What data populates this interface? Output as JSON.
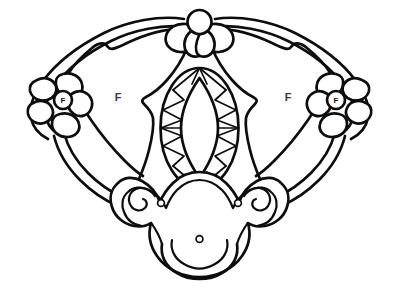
{
  "page": {
    "width": 399,
    "height": 299,
    "background_color": "#ffffff",
    "line_color": "#0d0d0d",
    "style": "black and white outline coloring page"
  },
  "labels": {
    "left_field": "F",
    "right_field": "F",
    "left_flower_center": "F",
    "right_flower_center": "F"
  },
  "artwork": {
    "subject": "symmetrical winged brooch with central oval gemstone",
    "components": [
      {
        "name": "left-wing",
        "description": "double outline scalloped wing panel sweeping left and down"
      },
      {
        "name": "right-wing",
        "description": "double outline scalloped wing panel sweeping right and down"
      },
      {
        "name": "top-flower",
        "description": "four petal blossom with round center at top apex"
      },
      {
        "name": "left-flower",
        "description": "five petal blossom with lettered round center"
      },
      {
        "name": "right-flower",
        "description": "five petal blossom with lettered round center"
      },
      {
        "name": "center-setting",
        "description": "angular notched mount framing the gemstone"
      },
      {
        "name": "center-gem",
        "description": "oval marquise cut stone with radiating triangular facets"
      },
      {
        "name": "bottom-cartouche",
        "description": "scrolled volute ornament with rivet holes"
      },
      {
        "name": "bottom-pendant",
        "description": "rounded drop lobe below the cartouche"
      }
    ],
    "rivet_count": 3
  },
  "colors": {
    "ink": "#0d0d0d",
    "paper": "#ffffff",
    "label_ink": "#3a3a3a"
  }
}
